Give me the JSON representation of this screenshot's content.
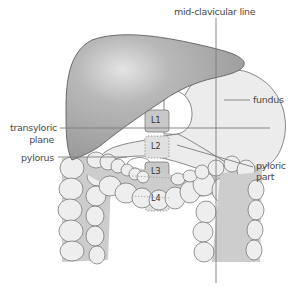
{
  "diagram": {
    "type": "anatomical-illustration",
    "labels": {
      "mid_clavicular_line": "mid-clavicular line",
      "fundus": "fundus",
      "transpyloric_plane_line1": "transyloric",
      "transpyloric_plane_line2": "plane",
      "pylorus": "pylorus",
      "pyloric_part_line1": "pyloric",
      "pyloric_part_line2": "part"
    },
    "vertebrae": [
      "L1",
      "L2",
      "L3",
      "L4"
    ],
    "colors": {
      "liver": "#a6a6a6",
      "liver_highlight": "#e2e2e2",
      "stomach": "#ececec",
      "colon": "#eeeeee",
      "colon_gap": "#cdcdcd",
      "vertebra": "#c8c8c8",
      "outline": "#6b6b6b",
      "reference_line": "#7a7a7a",
      "label_text": "#4a4a4a"
    }
  }
}
